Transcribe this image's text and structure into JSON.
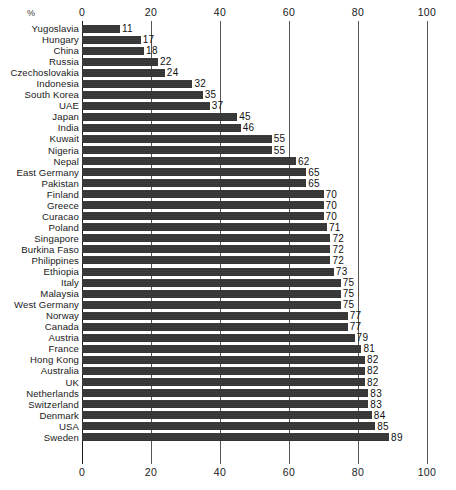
{
  "chart_data": {
    "type": "bar",
    "orientation": "horizontal",
    "title": "",
    "subtitle": "",
    "xlabel": "%",
    "ylabel": "",
    "xlim": [
      0,
      100
    ],
    "ticks": [
      0,
      20,
      40,
      60,
      80,
      100
    ],
    "grid": true,
    "legend": null,
    "axis_top": true,
    "axis_bottom": true,
    "bar_color": "#3a3a3a",
    "background_color": "#ffffff",
    "categories": [
      "Yugoslavia",
      "Hungary",
      "China",
      "Russia",
      "Czechoslovakia",
      "Indonesia",
      "South Korea",
      "UAE",
      "Japan",
      "India",
      "Kuwait",
      "Nigeria",
      "Nepal",
      "East Germany",
      "Pakistan",
      "Finland",
      "Greece",
      "Curacao",
      "Poland",
      "Singapore",
      "Burkina Faso",
      "Philippines",
      "Ethiopia",
      "Italy",
      "Malaysia",
      "West Germany",
      "Norway",
      "Canada",
      "Austria",
      "France",
      "Hong Kong",
      "Australia",
      "UK",
      "Netherlands",
      "Switzerland",
      "Denmark",
      "USA",
      "Sweden"
    ],
    "values": [
      11,
      17,
      18,
      22,
      24,
      32,
      35,
      37,
      45,
      46,
      55,
      55,
      62,
      65,
      65,
      70,
      70,
      70,
      71,
      72,
      72,
      72,
      73,
      75,
      75,
      75,
      77,
      77,
      79,
      81,
      82,
      82,
      82,
      83,
      83,
      84,
      85,
      89
    ],
    "value_labels": [
      "11",
      "17",
      "18",
      "22",
      "24",
      "32",
      "35",
      "37",
      "45",
      "46",
      "55",
      "55",
      "62",
      "65",
      "65",
      "70",
      "70",
      "70",
      "71",
      "72",
      "72",
      "72",
      "73",
      "75",
      "75",
      "75",
      "77",
      "77",
      "79",
      "81",
      "82",
      "82",
      "82",
      "83",
      "83",
      "84",
      "85",
      "89"
    ],
    "tick_labels": [
      "0",
      "20",
      "40",
      "60",
      "80",
      "100"
    ]
  }
}
